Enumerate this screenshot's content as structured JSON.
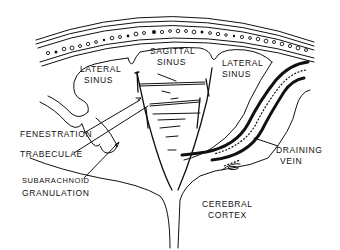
{
  "diagram": {
    "type": "anatomical line drawing",
    "colors": {
      "ink": "#111111",
      "background": "#ffffff"
    },
    "labels": {
      "sagittal_sinus": [
        "SAGITTAL",
        "SINUS"
      ],
      "lateral_sinus_left": [
        "LATERAL",
        "SINUS"
      ],
      "lateral_sinus_right": [
        "LATERAL",
        "SINUS"
      ],
      "fenestration": "FENESTRATION",
      "trabeculae": "TRABECULAE",
      "subarachnoid_granulation": [
        "SUBARACHNOID",
        "GRANULATION"
      ],
      "draining_vein": [
        "DRAINING",
        "VEIN"
      ],
      "cerebral_cortex": [
        "CEREBRAL",
        "CORTEX"
      ]
    }
  }
}
